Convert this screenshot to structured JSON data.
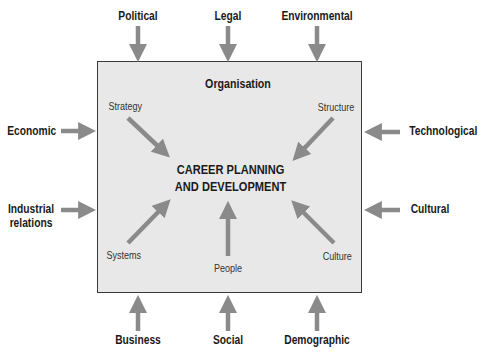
{
  "diagram": {
    "container_title": "Organisation",
    "center_line1": "CAREER PLANNING",
    "center_line2": "AND DEVELOPMENT",
    "external_factors": {
      "top": [
        "Political",
        "Legal",
        "Environmental"
      ],
      "left": [
        "Economic",
        "Industrial relations"
      ],
      "left_line1": "Industrial",
      "left_line2": "relations",
      "right": [
        "Technological",
        "Cultural"
      ],
      "bottom": [
        "Business",
        "Social",
        "Demographic"
      ]
    },
    "internal_factors": [
      "Strategy",
      "Structure",
      "Systems",
      "People",
      "Culture"
    ],
    "colors": {
      "arrow": "#8a8a8a",
      "box_fill": "#e8e8e8",
      "box_border": "#3a3a3a"
    }
  }
}
